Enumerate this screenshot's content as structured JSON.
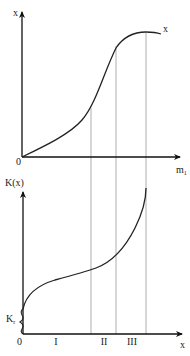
{
  "top_plot": {
    "y_axis_label": "x",
    "x_axis_label": "m",
    "x_axis_subscript": "1",
    "origin_label": "0",
    "curve_label": "x"
  },
  "bottom_plot": {
    "y_axis_label": "K(x)",
    "x_axis_label": "x",
    "origin_label": "0",
    "threshold_label": "K",
    "threshold_subscript": "r",
    "regions": [
      "I",
      "II",
      "III"
    ]
  },
  "colors": {
    "axis": "#111111",
    "curve": "#222222",
    "guide": "#999999"
  }
}
